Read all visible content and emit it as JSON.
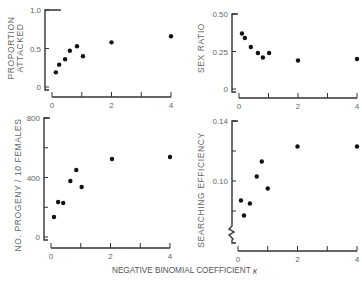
{
  "figure": {
    "shared_xlabel": "NEGATIVE BINOMIAL COEFFICIENT",
    "shared_xlabel_symbol": "κ"
  },
  "chart_data": [
    {
      "type": "scatter",
      "panel": "top-left",
      "title": "",
      "xlabel": "",
      "ylabel_lines": [
        "PROPORTION",
        "ATTACKED"
      ],
      "xlim": [
        0,
        4
      ],
      "ylim": [
        0,
        1.0
      ],
      "x_ticks": [
        0,
        1,
        2,
        3,
        4
      ],
      "x_tick_labels": [
        "0",
        "",
        "2",
        "",
        "4"
      ],
      "y_ticks": [
        0,
        0.5,
        1.0
      ],
      "y_tick_labels": [
        "0",
        "0.5",
        "1.0"
      ],
      "x": [
        0.13,
        0.24,
        0.44,
        0.6,
        0.84,
        1.04,
        2.0,
        4.0
      ],
      "y": [
        0.19,
        0.29,
        0.36,
        0.47,
        0.53,
        0.4,
        0.58,
        0.66
      ],
      "grid": false
    },
    {
      "type": "scatter",
      "panel": "top-right",
      "title": "",
      "xlabel": "",
      "ylabel_lines": [
        "SEX RATIO"
      ],
      "xlim": [
        0,
        4
      ],
      "ylim": [
        0,
        0.5
      ],
      "x_ticks": [
        0,
        1,
        2,
        3,
        4
      ],
      "x_tick_labels": [
        "0",
        "",
        "2",
        "",
        "4"
      ],
      "y_ticks": [
        0,
        0.25,
        0.5
      ],
      "y_tick_labels": [
        "0",
        "0.25",
        "0.50"
      ],
      "x": [
        0.1,
        0.2,
        0.4,
        0.64,
        0.81,
        1.02,
        2.0,
        4.0
      ],
      "y": [
        0.37,
        0.34,
        0.28,
        0.24,
        0.21,
        0.24,
        0.19,
        0.2
      ],
      "grid": false
    },
    {
      "type": "scatter",
      "panel": "bottom-left",
      "title": "",
      "xlabel": "",
      "ylabel_lines": [
        "NO. PROGENY / 10 FEMALES"
      ],
      "xlim": [
        0,
        4
      ],
      "ylim": [
        0,
        800
      ],
      "x_ticks": [
        0,
        1,
        2,
        3,
        4
      ],
      "x_tick_labels": [
        "0",
        "",
        "2",
        "",
        "4"
      ],
      "y_ticks": [
        0,
        200,
        400,
        600,
        800
      ],
      "y_tick_labels": [
        "0",
        "",
        "400",
        "",
        "800"
      ],
      "x": [
        0.1,
        0.24,
        0.41,
        0.65,
        0.85,
        1.03,
        2.05,
        4.0
      ],
      "y": [
        134,
        235,
        229,
        376,
        450,
        336,
        524,
        538
      ],
      "grid": false
    },
    {
      "type": "scatter",
      "panel": "bottom-right",
      "title": "",
      "xlabel": "",
      "ylabel_lines": [
        "SEARCHING EFFICIENCY"
      ],
      "xlim": [
        0,
        4
      ],
      "ylim": [
        0.07,
        0.14
      ],
      "y_axis_break": true,
      "x_ticks": [
        0,
        1,
        2,
        3,
        4
      ],
      "x_tick_labels": [
        "0",
        "",
        "2",
        "",
        "4"
      ],
      "y_ticks": [
        0.08,
        0.1,
        0.12,
        0.14
      ],
      "y_tick_labels": [
        "",
        "0.10",
        "",
        "0.14"
      ],
      "x": [
        0.1,
        0.2,
        0.4,
        0.63,
        0.8,
        1.0,
        2.0,
        4.0
      ],
      "y": [
        0.087,
        0.077,
        0.085,
        0.103,
        0.113,
        0.095,
        0.123,
        0.123
      ],
      "grid": false
    }
  ]
}
